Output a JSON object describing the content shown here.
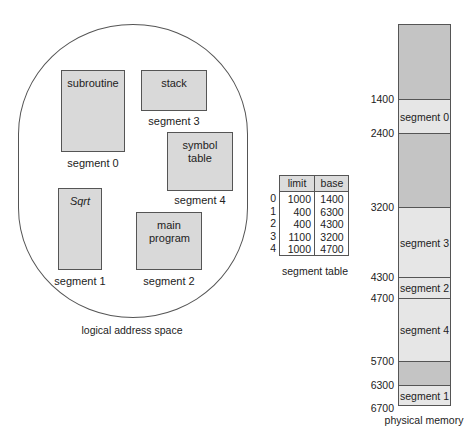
{
  "logical_space": {
    "caption": "logical address space",
    "segments": [
      {
        "name": "subroutine",
        "label": "segment 0"
      },
      {
        "name": "Sqrt",
        "label": "segment 1"
      },
      {
        "name": "main program",
        "label": "segment 2"
      },
      {
        "name": "stack",
        "label": "segment 3"
      },
      {
        "name": "symbol table",
        "label": "segment 4"
      }
    ]
  },
  "segment_table": {
    "caption": "segment table",
    "headers": [
      "limit",
      "base"
    ],
    "rows": [
      {
        "index": "0",
        "limit": "1000",
        "base": "1400"
      },
      {
        "index": "1",
        "limit": "400",
        "base": "6300"
      },
      {
        "index": "2",
        "limit": "400",
        "base": "4300"
      },
      {
        "index": "3",
        "limit": "1100",
        "base": "3200"
      },
      {
        "index": "4",
        "limit": "1000",
        "base": "4700"
      }
    ]
  },
  "physical_memory": {
    "caption": "physical memory",
    "addresses": [
      "1400",
      "2400",
      "3200",
      "4300",
      "4700",
      "5700",
      "6300",
      "6700"
    ],
    "blocks": [
      {
        "label": "",
        "color": "#c4c4c4"
      },
      {
        "label": "segment 0",
        "color": "#e6e6e6"
      },
      {
        "label": "",
        "color": "#c4c4c4"
      },
      {
        "label": "segment 3",
        "color": "#e6e6e6"
      },
      {
        "label": "segment 2",
        "color": "#e6e6e6"
      },
      {
        "label": "segment 4",
        "color": "#e6e6e6"
      },
      {
        "label": "",
        "color": "#c4c4c4"
      },
      {
        "label": "segment 1",
        "color": "#e6e6e6"
      }
    ]
  },
  "colors": {
    "segment_fill": "#d9d9d9",
    "free_memory": "#c4c4c4",
    "allocated_memory": "#e6e6e6",
    "border": "#555555"
  }
}
